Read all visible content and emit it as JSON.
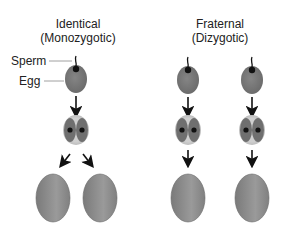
{
  "diagram": {
    "columns": [
      {
        "id": "identical",
        "title_line1": "Identical",
        "title_line2": "(Monozygotic)"
      },
      {
        "id": "fraternal",
        "title_line1": "Fraternal",
        "title_line2": "(Dizygotic)"
      }
    ],
    "labels": {
      "sperm": "Sperm",
      "egg": "Egg"
    },
    "colors": {
      "egg_fill": "#7a7a7a",
      "zygote_outer": "#bdbdbd",
      "zygote_inner": "#6f6f6f",
      "nucleus": "#111111",
      "embryo_fill": "#8c8c8c",
      "arrow": "#111111"
    }
  }
}
